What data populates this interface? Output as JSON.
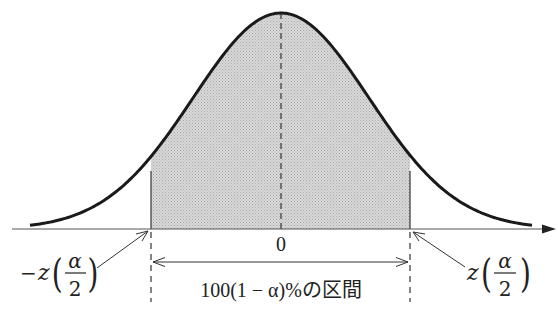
{
  "figure": {
    "title": "",
    "center_label": "0",
    "left_bound": {
      "sign": "−",
      "var": "z",
      "num": "α",
      "den": "2"
    },
    "right_bound": {
      "sign": "",
      "var": "z",
      "num": "α",
      "den": "2"
    },
    "interval_label": "100(1 − α)%の区間",
    "shade_color": "#cfcfcf",
    "curve_color": "#1a1a1a"
  }
}
